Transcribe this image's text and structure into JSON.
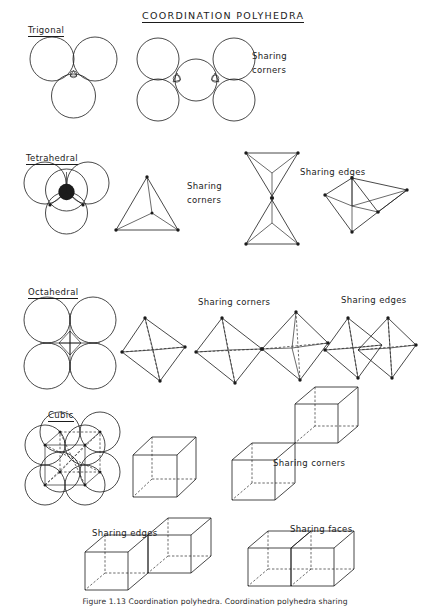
{
  "figure": {
    "title": "COORDINATION   POLYHEDRA",
    "caption": "Figure 1.13 Coordination polyhedra. Coordination polyhedra sharing",
    "ink_color": "#1b1b1b",
    "background_color": "#ffffff"
  },
  "rows": [
    {
      "name": "trigonal",
      "label": "Trigonal",
      "sharing_label": "Sharing",
      "sharing_label_line2": "corners",
      "sphere_count": 3,
      "packing": "three spheres in triangular contact with central trigonal interstice",
      "polyhedron": "triangle"
    },
    {
      "name": "tetrahedral",
      "label": "Tetrahedral",
      "packing": "four spheres with filled central cation",
      "polyhedron": "tetrahedron",
      "sharing_corners_line1": "Sharing",
      "sharing_corners_line2": "corners",
      "sharing_edges": "Sharing edges"
    },
    {
      "name": "octahedral",
      "label": "Octahedral",
      "packing": "four spheres square arrangement with square interstice",
      "polyhedron": "octahedron",
      "sharing_corners": "Sharing corners",
      "sharing_edges": "Sharing edges"
    },
    {
      "name": "cubic",
      "label": "Cubic",
      "packing": "eight spheres cubic arrangement with inscribed cube",
      "polyhedron": "cube",
      "sharing_corners": "Sharing corners"
    },
    {
      "name": "cubic-bottom",
      "sharing_edges": "Sharing edges",
      "sharing_faces": "Sharing faces"
    }
  ]
}
